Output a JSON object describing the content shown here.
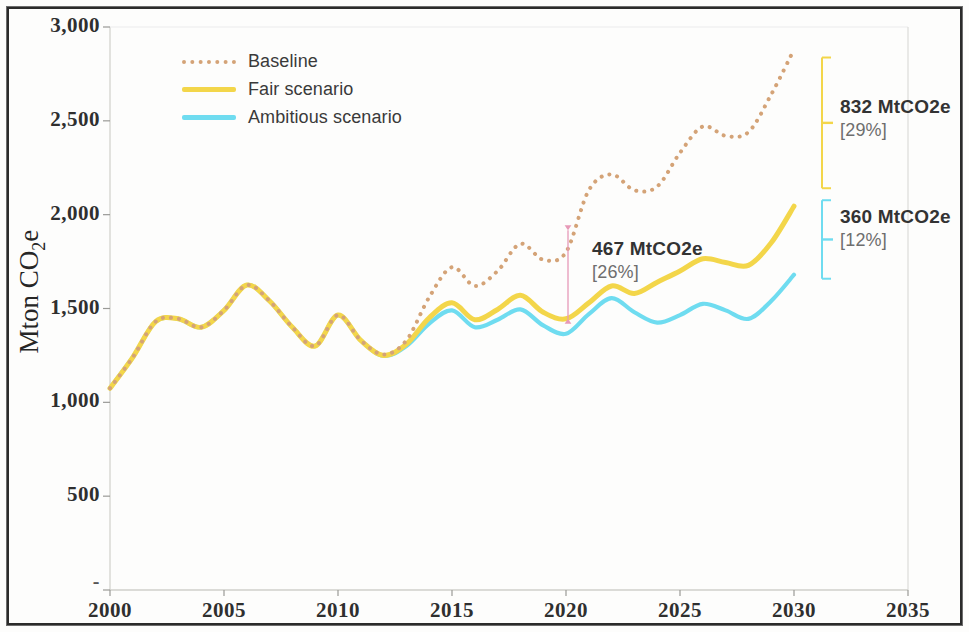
{
  "chart_data": {
    "type": "line",
    "title": "",
    "xlabel": "",
    "ylabel": "Mton CO2e",
    "ylabel_rich": {
      "prefix": "Mton CO",
      "sub": "2",
      "suffix": "e"
    },
    "xlim": [
      2000,
      2035
    ],
    "ylim": [
      0,
      3000
    ],
    "x_ticks": [
      "2000",
      "2005",
      "2010",
      "2015",
      "2020",
      "2025",
      "2030",
      "2035"
    ],
    "x_tick_values": [
      2000,
      2005,
      2010,
      2015,
      2020,
      2025,
      2030,
      2035
    ],
    "y_ticks": [
      "-",
      "500",
      "1,000",
      "1,500",
      "2,000",
      "2,500",
      "3,000"
    ],
    "y_tick_values": [
      0,
      500,
      1000,
      1500,
      2000,
      2500,
      3000
    ],
    "grid": false,
    "legend_position": "top-left",
    "x": [
      2000,
      2001,
      2002,
      2003,
      2004,
      2005,
      2006,
      2007,
      2008,
      2009,
      2010,
      2011,
      2012,
      2013,
      2014,
      2015,
      2016,
      2017,
      2018,
      2019,
      2020,
      2021,
      2022,
      2023,
      2024,
      2025,
      2026,
      2027,
      2028,
      2029,
      2030
    ],
    "series": [
      {
        "name": "Baseline",
        "style": "dotted",
        "color": "#d4a377",
        "values": [
          1075,
          1240,
          1430,
          1445,
          1400,
          1490,
          1625,
          1540,
          1400,
          1300,
          1465,
          1330,
          1255,
          1330,
          1560,
          1720,
          1620,
          1700,
          1845,
          1760,
          1800,
          2130,
          2215,
          2130,
          2150,
          2330,
          2470,
          2420,
          2440,
          2640,
          2880
        ]
      },
      {
        "name": "Fair scenario",
        "style": "solid",
        "color": "#f3d64a",
        "values": [
          1075,
          1240,
          1430,
          1445,
          1400,
          1490,
          1625,
          1540,
          1400,
          1300,
          1465,
          1330,
          1250,
          1310,
          1450,
          1530,
          1440,
          1495,
          1570,
          1480,
          1445,
          1530,
          1620,
          1580,
          1640,
          1700,
          1765,
          1745,
          1730,
          1850,
          2045
        ]
      },
      {
        "name": "Ambitious scenario",
        "style": "solid",
        "color": "#6fdcf0",
        "values": [
          1075,
          1240,
          1430,
          1445,
          1400,
          1490,
          1625,
          1540,
          1400,
          1300,
          1465,
          1330,
          1248,
          1300,
          1420,
          1490,
          1400,
          1440,
          1495,
          1410,
          1365,
          1470,
          1555,
          1480,
          1425,
          1465,
          1525,
          1490,
          1445,
          1540,
          1680
        ]
      }
    ],
    "annotations": [
      {
        "id": "mid",
        "value": "467 MtCO2e",
        "percent": "[26%]",
        "at_year": 2020,
        "between": [
          "Baseline",
          "Fair scenario"
        ],
        "marker_color": "#e79ab8"
      },
      {
        "id": "top",
        "value": "832 MtCO2e",
        "percent": "[29%]",
        "at_year": 2030,
        "between": [
          "Baseline",
          "Fair scenario"
        ],
        "marker_color": "#f3d64a"
      },
      {
        "id": "bottom",
        "value": "360 MtCO2e",
        "percent": "[12%]",
        "at_year": 2030,
        "between": [
          "Fair scenario",
          "Ambitious scenario"
        ],
        "marker_color": "#6fdcf0"
      }
    ]
  },
  "legend": {
    "items": [
      {
        "label": "Baseline",
        "color": "#d4a377",
        "style": "dotted"
      },
      {
        "label": "Fair scenario",
        "color": "#f3d64a",
        "style": "solid"
      },
      {
        "label": "Ambitious scenario",
        "color": "#6fdcf0",
        "style": "solid"
      }
    ]
  },
  "axis": {
    "y_label_prefix": "Mton CO",
    "y_label_sub": "2",
    "y_label_suffix": "e"
  }
}
